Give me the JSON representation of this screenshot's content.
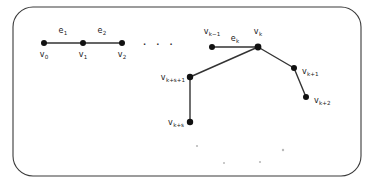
{
  "figure": {
    "frame": {
      "name": "rounded-rectangle-border",
      "x": 13,
      "y": 7,
      "width": 348,
      "height": 169,
      "radius": 20,
      "stroke_color": "#3a3a3a"
    },
    "colors": {
      "node": "#111111",
      "edge": "#333333",
      "text": "#1a1a1a",
      "noise": "#b9b9b9",
      "background": "#ffffff"
    },
    "nodes": [
      {
        "id": "v0",
        "base": "v",
        "sub": "0",
        "cx": 44,
        "cy": 43,
        "r": 3.0,
        "label_x": 44,
        "label_y": 57,
        "anchor": "middle"
      },
      {
        "id": "v1",
        "base": "v",
        "sub": "1",
        "cx": 83,
        "cy": 43,
        "r": 3.0,
        "label_x": 83,
        "label_y": 57,
        "anchor": "middle"
      },
      {
        "id": "v2",
        "base": "v",
        "sub": "2",
        "cx": 122,
        "cy": 43,
        "r": 3.0,
        "label_x": 122,
        "label_y": 57,
        "anchor": "middle"
      },
      {
        "id": "vk-1",
        "base": "v",
        "sub": "k−1",
        "cx": 212,
        "cy": 47,
        "r": 3.0,
        "label_x": 212,
        "label_y": 34,
        "anchor": "middle"
      },
      {
        "id": "vk",
        "base": "v",
        "sub": "k",
        "cx": 258,
        "cy": 47,
        "r": 3.4,
        "label_x": 258,
        "label_y": 34,
        "anchor": "middle"
      },
      {
        "id": "vk+1",
        "base": "v",
        "sub": "k+1",
        "cx": 294,
        "cy": 68,
        "r": 3.0,
        "label_x": 302,
        "label_y": 74,
        "anchor": "start"
      },
      {
        "id": "vk+2",
        "base": "v",
        "sub": "k+2",
        "cx": 306,
        "cy": 97,
        "r": 3.0,
        "label_x": 314,
        "label_y": 103,
        "anchor": "start"
      },
      {
        "id": "vk+s+1",
        "base": "v",
        "sub": "k+s+1",
        "cx": 190,
        "cy": 77,
        "r": 3.2,
        "label_x": 185,
        "label_y": 80,
        "anchor": "end"
      },
      {
        "id": "vk+s",
        "base": "v",
        "sub": "k+s",
        "cx": 190,
        "cy": 122,
        "r": 3.2,
        "label_x": 184,
        "label_y": 125,
        "anchor": "end"
      }
    ],
    "edges": [
      {
        "id": "e1",
        "from": "v0",
        "to": "v1",
        "label_base": "e",
        "label_sub": "1",
        "label_x": 63,
        "label_y": 33
      },
      {
        "id": "e2",
        "from": "v1",
        "to": "v2",
        "label_base": "e",
        "label_sub": "2",
        "label_x": 102,
        "label_y": 33
      },
      {
        "id": "ek",
        "from": "vk-1",
        "to": "vk",
        "label_base": "e",
        "label_sub": "k",
        "label_x": 235,
        "label_y": 41
      },
      {
        "id": "ek+1",
        "from": "vk",
        "to": "vk+1",
        "label_base": "",
        "label_sub": "",
        "label_x": 0,
        "label_y": 0
      },
      {
        "id": "ek+2",
        "from": "vk+1",
        "to": "vk+2",
        "label_base": "",
        "label_sub": "",
        "label_x": 0,
        "label_y": 0
      },
      {
        "id": "eks1",
        "from": "vk",
        "to": "vk+s+1",
        "label_base": "",
        "label_sub": "",
        "label_x": 0,
        "label_y": 0
      },
      {
        "id": "eks",
        "from": "vk+s+1",
        "to": "vk+s",
        "label_base": "",
        "label_sub": "",
        "label_x": 0,
        "label_y": 0
      }
    ],
    "ellipsis": {
      "text": "· · ·",
      "x": 159,
      "y": 49
    },
    "noise_dots": [
      {
        "cx": 197,
        "cy": 146,
        "r": 1.1
      },
      {
        "cx": 224,
        "cy": 163,
        "r": 1.0
      },
      {
        "cx": 260,
        "cy": 162,
        "r": 1.1
      },
      {
        "cx": 283,
        "cy": 150,
        "r": 1.2
      }
    ]
  }
}
